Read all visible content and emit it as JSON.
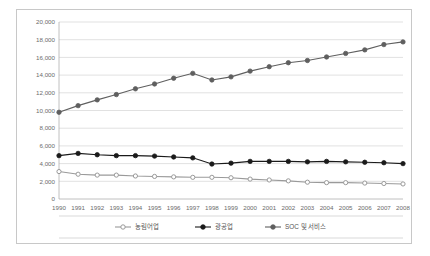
{
  "chart_data": {
    "type": "line",
    "title": "",
    "subtitle": "",
    "xlabel": "",
    "ylabel": "",
    "grid": true,
    "legend_position": "bottom",
    "ylim": [
      0,
      20000
    ],
    "yticks": [
      "0",
      "2,000",
      "4,000",
      "6,000",
      "8,000",
      "10,000",
      "12,000",
      "14,000",
      "16,000",
      "18,000",
      "20,000"
    ],
    "ytick_values": [
      0,
      2000,
      4000,
      6000,
      8000,
      10000,
      12000,
      14000,
      16000,
      18000,
      20000
    ],
    "categories": [
      "1990",
      "1991",
      "1992",
      "1993",
      "1994",
      "1995",
      "1996",
      "1997",
      "1998",
      "1999",
      "2000",
      "2001",
      "2002",
      "2003",
      "2004",
      "2005",
      "2006",
      "2007",
      "2008"
    ],
    "series": [
      {
        "name": "농림어업",
        "marker": "open-circle",
        "color": "#9a9a9a",
        "values": [
          3100,
          2800,
          2700,
          2700,
          2600,
          2550,
          2500,
          2450,
          2450,
          2400,
          2250,
          2150,
          2050,
          1900,
          1850,
          1850,
          1800,
          1750,
          1700
        ]
      },
      {
        "name": "광공업",
        "marker": "filled-circle",
        "color": "#1a1a1a",
        "values": [
          4900,
          5150,
          5000,
          4900,
          4900,
          4850,
          4750,
          4650,
          3950,
          4050,
          4250,
          4250,
          4250,
          4200,
          4250,
          4200,
          4150,
          4100,
          4000
        ]
      },
      {
        "name": "SOC 및 서비스",
        "marker": "filled-circle",
        "color": "#5f5f5f",
        "values": [
          9800,
          10550,
          11200,
          11800,
          12450,
          13000,
          13650,
          14200,
          13450,
          13800,
          14450,
          14950,
          15400,
          15650,
          16050,
          16450,
          16850,
          17450,
          17750
        ]
      }
    ]
  }
}
